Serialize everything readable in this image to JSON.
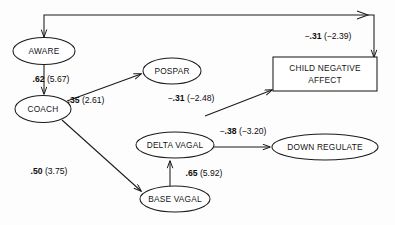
{
  "diagram": {
    "type": "path-diagram",
    "nodes": [
      {
        "id": "aware",
        "label": "AWARE",
        "shape": "ellipse",
        "cx": 44,
        "cy": 51,
        "rx": 31,
        "ry": 13.5
      },
      {
        "id": "coach",
        "label": "COACH",
        "shape": "ellipse",
        "cx": 43,
        "cy": 109,
        "rx": 28,
        "ry": 13.5
      },
      {
        "id": "pospar",
        "label": "POSPAR",
        "shape": "ellipse",
        "cx": 172,
        "cy": 71,
        "rx": 29,
        "ry": 13
      },
      {
        "id": "cna",
        "label": "CHILD NEGATIVE",
        "label2": "AFFECT",
        "shape": "rect",
        "x": 273,
        "y": 57,
        "w": 104,
        "h": 34
      },
      {
        "id": "delta",
        "label": "DELTA VAGAL",
        "shape": "ellipse",
        "cx": 175,
        "cy": 145,
        "rx": 39,
        "ry": 13
      },
      {
        "id": "base",
        "label": "BASE VAGAL",
        "shape": "ellipse",
        "cx": 175,
        "cy": 199,
        "rx": 35,
        "ry": 13
      },
      {
        "id": "down",
        "label": "DOWN REGULATE",
        "shape": "ellipse",
        "cx": 325,
        "cy": 147,
        "rx": 53,
        "ry": 13
      }
    ],
    "edges": [
      {
        "id": "aware-cna",
        "from": "aware",
        "to": "cna",
        "coef": ".31",
        "sign": "−",
        "t": "(−2.39)",
        "t_sign": "",
        "label_x": 328,
        "label_y": 39
      },
      {
        "id": "aware-coach",
        "from": "aware",
        "to": "coach",
        "coef": ".62",
        "sign": "",
        "t": "(5.67)",
        "label_x": 51,
        "label_y": 82
      },
      {
        "id": "coach-pospar",
        "from": "coach",
        "to": "pospar",
        "coef": ".35",
        "sign": "",
        "t": "(2.61)",
        "label_x": 86,
        "label_y": 103
      },
      {
        "id": "pospar-cna",
        "from": "pospar",
        "to": "cna",
        "coef": ".31",
        "sign": "−",
        "t": "(−2.48)",
        "label_x": 191,
        "label_y": 101
      },
      {
        "id": "coach-base",
        "from": "coach",
        "to": "base",
        "coef": ".50",
        "sign": "",
        "t": "(3.75)",
        "label_x": 49,
        "label_y": 174
      },
      {
        "id": "base-delta",
        "from": "base",
        "to": "delta",
        "coef": ".65",
        "sign": "",
        "t": "(5.92)",
        "label_x": 175,
        "label_y": 176
      },
      {
        "id": "delta-down",
        "from": "delta",
        "to": "down",
        "coef": ".38",
        "sign": "−",
        "t": "(−3.20)",
        "label_x": 212,
        "label_y": 134
      }
    ]
  }
}
